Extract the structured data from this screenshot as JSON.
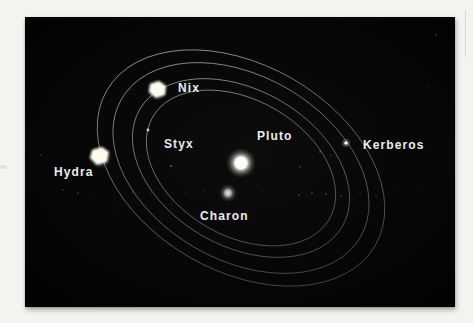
{
  "page": {
    "background_color": "#f5f3f0",
    "artifact_line": {
      "x": 465,
      "y": 10,
      "height": 47,
      "color": "#d6d4d0"
    },
    "artifact_smudge": {
      "x": 0,
      "y": 165,
      "width": 7,
      "height": 4
    }
  },
  "diagram": {
    "background_color": "#060606",
    "label_color": "#ededec",
    "orbit_line_color": "#c8c8c5",
    "frame": {
      "x": 25,
      "y": 17,
      "width": 430,
      "height": 290
    },
    "center": {
      "x": 241,
      "y": 168
    },
    "rotation_deg": 30,
    "orbits": [
      {
        "name": "styx-orbit",
        "rx": 102,
        "ry": 68
      },
      {
        "name": "nix-orbit",
        "rx": 117,
        "ry": 78
      },
      {
        "name": "kerberos-orbit",
        "rx": 138,
        "ry": 92
      },
      {
        "name": "hydra-orbit",
        "rx": 155,
        "ry": 103
      }
    ],
    "bodies": [
      {
        "id": "pluto",
        "label": "Pluto",
        "x": 241,
        "y": 163,
        "render": "glow",
        "gradient": "pluto-grad",
        "glow_r": 15,
        "label_x": 257,
        "label_y": 130
      },
      {
        "id": "charon",
        "label": "Charon",
        "x": 228,
        "y": 193,
        "render": "glow",
        "gradient": "charon-grad",
        "glow_r": 9,
        "label_x": 200,
        "label_y": 210
      },
      {
        "id": "nix",
        "label": "Nix",
        "x": 157,
        "y": 90,
        "render": "blob",
        "points": "150,84 159,81 166,86 165,95 156,98 149,92",
        "glow_r": 11,
        "label_x": 178,
        "label_y": 82
      },
      {
        "id": "styx",
        "label": "Styx",
        "x": 148,
        "y": 130,
        "render": "dot",
        "r": 1.4,
        "opacity": 0.75,
        "label_x": 164,
        "label_y": 138
      },
      {
        "id": "kerberos",
        "label": "Kerberos",
        "x": 346,
        "y": 143,
        "render": "dot",
        "r": 1.8,
        "opacity": 1,
        "halo_r": 4,
        "label_x": 363,
        "label_y": 139
      },
      {
        "id": "hydra",
        "label": "Hydra",
        "x": 100,
        "y": 157,
        "render": "blob",
        "points": "92,150 102,147 109,152 107,162 97,165 90,158",
        "glow_r": 12,
        "label_x": 54,
        "label_y": 166
      }
    ],
    "speckles": [
      [
        63,
        190,
        1.0,
        0.14
      ],
      [
        78,
        193,
        0.9,
        0.18
      ],
      [
        90,
        194,
        0.8,
        0.12
      ],
      [
        41,
        155,
        1.0,
        0.15
      ],
      [
        133,
        192,
        0.9,
        0.16
      ],
      [
        151,
        194,
        0.8,
        0.14
      ],
      [
        171,
        166,
        1.1,
        0.3
      ],
      [
        186,
        193,
        0.8,
        0.13
      ],
      [
        205,
        190,
        0.9,
        0.12
      ],
      [
        262,
        191,
        0.8,
        0.12
      ],
      [
        299,
        195,
        1.0,
        0.2
      ],
      [
        312,
        193,
        0.9,
        0.22
      ],
      [
        326,
        194,
        1.0,
        0.2
      ],
      [
        341,
        196,
        0.9,
        0.18
      ],
      [
        360,
        193,
        0.8,
        0.16
      ],
      [
        376,
        196,
        0.9,
        0.15
      ],
      [
        395,
        191,
        0.8,
        0.12
      ],
      [
        420,
        190,
        0.7,
        0.1
      ],
      [
        300,
        167,
        0.9,
        0.18
      ],
      [
        311,
        168,
        0.8,
        0.14
      ],
      [
        320,
        152,
        1.0,
        0.22
      ],
      [
        331,
        155,
        0.8,
        0.16
      ],
      [
        436,
        35,
        0.9,
        0.2
      ],
      [
        429,
        87,
        0.8,
        0.15
      ],
      [
        370,
        120,
        0.7,
        0.12
      ],
      [
        232,
        226,
        0.8,
        0.1
      ],
      [
        160,
        227,
        0.7,
        0.1
      ],
      [
        117,
        208,
        0.8,
        0.12
      ]
    ]
  }
}
